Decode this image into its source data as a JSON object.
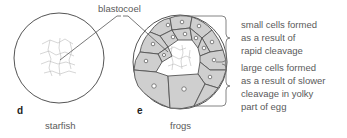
{
  "figure": {
    "callout_label": "blastocoel",
    "panels": [
      {
        "letter": "d",
        "caption": "starfish"
      },
      {
        "letter": "e",
        "caption": "frogs"
      }
    ],
    "annotations": {
      "upper": [
        "small cells formed",
        "as a result of",
        "rapid cleavage"
      ],
      "lower": [
        "large cells formed",
        "as a result of slower",
        "cleavage in yolky",
        "part of egg"
      ]
    },
    "colors": {
      "cell_fill": "#cfcfcf",
      "outline": "#555555",
      "cavity_line": "#b5b5b5",
      "background": "#ffffff"
    }
  }
}
